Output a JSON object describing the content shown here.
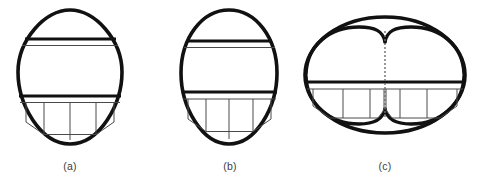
{
  "figure": {
    "background_color": "#ffffff",
    "outline_color": "#111111",
    "inner_line_color": "#4a4a4a",
    "dashed_line_color": "#6e6e6e",
    "caption_color": "#3b3b3b",
    "panels": [
      {
        "id": "a",
        "caption": "(a)",
        "shape_name": "egg-teardrop-outline",
        "center_x": 70,
        "center_y": 77,
        "half_width": 52,
        "half_height": 67,
        "outline_stroke_width": 3.6,
        "thick_divider_stroke_width": 3.2,
        "thin_line_stroke_width": 1.0,
        "upper_divider_y": 39,
        "upper_thin_y": 45,
        "lower_divider_y": 96,
        "lower_thin_y": 102,
        "panel_bottom_y": 134,
        "panel_verticals_x": [
          42,
          70,
          98
        ],
        "lobes": 1,
        "dashed_center_line": false
      },
      {
        "id": "b",
        "caption": "(b)",
        "shape_name": "egg-oval-outline",
        "center_x": 229,
        "center_y": 77,
        "half_width": 48,
        "half_height": 67,
        "outline_stroke_width": 3.6,
        "thick_divider_stroke_width": 3.2,
        "thin_line_stroke_width": 1.0,
        "upper_divider_y": 41,
        "upper_thin_y": 47,
        "lower_divider_y": 92,
        "lower_thin_y": 99,
        "panel_bottom_y": 131,
        "panel_verticals_x": [
          203,
          229,
          255
        ],
        "lobes": 1,
        "dashed_center_line": false
      },
      {
        "id": "c",
        "caption": "(c)",
        "shape_name": "double-lobed-oval-outline",
        "center_x": 385,
        "center_y": 75,
        "half_width": 80,
        "half_height": 59,
        "outline_stroke_width": 3.6,
        "thick_divider_stroke_width": 3.2,
        "thin_line_stroke_width": 1.0,
        "upper_divider_y": 0,
        "upper_thin_y": 0,
        "lower_divider_y": 82,
        "lower_thin_y": 89,
        "panel_bottom_y": 118,
        "panel_verticals_x": [
          343,
          370,
          400,
          427
        ],
        "lobes": 2,
        "dashed_center_line": true,
        "dashed_line_x": 385,
        "dashed_line_top_y": 31,
        "dashed_line_bottom_y": 118
      }
    ]
  }
}
